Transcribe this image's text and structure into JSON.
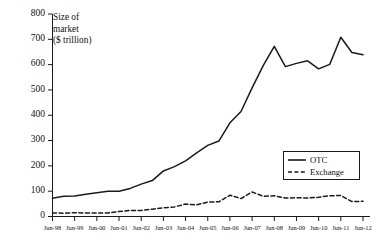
{
  "chart_data": {
    "type": "line",
    "title": "",
    "xlabel": "",
    "ylabel": "Size of market ($ trillion)",
    "ylabel_lines": [
      "Size of",
      "market",
      "($ trillion)"
    ],
    "ylim": [
      0,
      800
    ],
    "yticks": [
      0,
      100,
      200,
      300,
      400,
      500,
      600,
      700,
      800
    ],
    "ytick_labels": [
      "0",
      "100",
      "200",
      "300",
      "400",
      "500",
      "600",
      "700",
      "800"
    ],
    "grid": false,
    "legend_position": "center-right",
    "categories": [
      "Jun-98",
      "Jun-99",
      "Jun-00",
      "Jun-01",
      "Jun-02",
      "Jun-03",
      "Jun-04",
      "Jun-05",
      "Jun-06",
      "Jun-07",
      "Jun-08",
      "Jun-09",
      "Jun-10",
      "Jun-11",
      "Jun-12"
    ],
    "x": [
      1998,
      1999,
      2000,
      2001,
      2002,
      2003,
      2004,
      2005,
      2006,
      2007,
      2008,
      2009,
      2010,
      2011,
      2012
    ],
    "series": [
      {
        "name": "OTC",
        "style": "solid",
        "color": "#1a1a1a",
        "values": [
          72,
          81,
          94,
          100,
          128,
          180,
          220,
          281,
          370,
          508,
          672,
          605,
          583,
          708,
          639
        ]
      },
      {
        "name": "Exchange",
        "style": "dashed",
        "color": "#1a1a1a",
        "values": [
          14,
          15,
          14,
          20,
          24,
          34,
          49,
          57,
          84,
          97,
          82,
          74,
          76,
          83,
          60
        ]
      }
    ],
    "series_semiannual": {
      "note": "semi-annual observations rendered between the annual Jun ticks",
      "OTC": [
        72,
        80,
        81,
        88,
        94,
        100,
        100,
        111,
        128,
        142,
        180,
        197,
        220,
        251,
        281,
        298,
        370,
        415,
        508,
        596,
        672,
        592,
        605,
        615,
        583,
        601,
        708,
        648,
        639
      ],
      "Exchange": [
        14,
        13,
        15,
        14,
        14,
        14,
        20,
        24,
        24,
        29,
        34,
        38,
        49,
        46,
        57,
        58,
        84,
        71,
        97,
        80,
        82,
        73,
        74,
        73,
        76,
        82,
        83,
        59,
        60
      ]
    },
    "legend": [
      {
        "label": "OTC",
        "style": "solid"
      },
      {
        "label": "Exchange",
        "style": "dashed"
      }
    ]
  },
  "axis": {
    "caption_line1": "Size of",
    "caption_line2": "market",
    "caption_line3": "($ trillion)"
  },
  "legend": {
    "otc_label": "OTC",
    "exchange_label": "Exchange"
  },
  "colors": {
    "line": "#1a1a1a",
    "axis": "#1a1a1a",
    "background": "#ffffff",
    "text": "#111111"
  }
}
